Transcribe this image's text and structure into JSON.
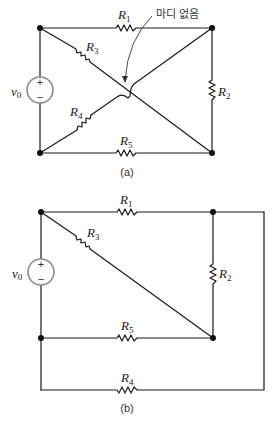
{
  "figure_a": {
    "caption": "(a)",
    "annotation": "마디 없음",
    "source": {
      "label_main": "v",
      "label_sub": "0",
      "plus": "+",
      "minus": "−"
    },
    "resistors": [
      {
        "id": "R1",
        "main": "R",
        "sub": "1"
      },
      {
        "id": "R2",
        "main": "R",
        "sub": "2"
      },
      {
        "id": "R3",
        "main": "R",
        "sub": "3"
      },
      {
        "id": "R4",
        "main": "R",
        "sub": "4"
      },
      {
        "id": "R5",
        "main": "R",
        "sub": "5"
      }
    ]
  },
  "figure_b": {
    "caption": "(b)",
    "source": {
      "label_main": "v",
      "label_sub": "0",
      "plus": "+",
      "minus": "−"
    },
    "resistors": [
      {
        "id": "R1",
        "main": "R",
        "sub": "1"
      },
      {
        "id": "R2",
        "main": "R",
        "sub": "2"
      },
      {
        "id": "R3",
        "main": "R",
        "sub": "3"
      },
      {
        "id": "R4",
        "main": "R",
        "sub": "4"
      },
      {
        "id": "R5",
        "main": "R",
        "sub": "5"
      }
    ]
  },
  "colors": {
    "wire": "#1a1a1a",
    "source_outline": "#8a8a8a"
  }
}
